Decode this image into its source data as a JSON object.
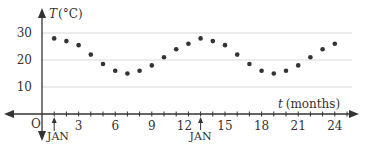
{
  "chart_data": {
    "type": "scatter",
    "title": "",
    "xlabel": "t (months)",
    "ylabel": "T (°C)",
    "x": [
      1,
      2,
      3,
      4,
      5,
      6,
      7,
      8,
      9,
      10,
      11,
      12,
      13,
      14,
      15,
      16,
      17,
      18,
      19,
      20,
      21,
      22,
      23,
      24
    ],
    "series": [
      {
        "name": "Temperature",
        "values": [
          28,
          27,
          25.5,
          22,
          18.5,
          16,
          15,
          16,
          18,
          21,
          24,
          26,
          28,
          27,
          25.5,
          22,
          18.5,
          16,
          15,
          16,
          18,
          21,
          24,
          26
        ]
      }
    ],
    "x_ticks": [
      "3",
      "6",
      "9",
      "12",
      "15",
      "18",
      "21",
      "24"
    ],
    "y_ticks": [
      "10",
      "20",
      "30"
    ],
    "origin_label": "O",
    "annotations": [
      {
        "label": "JAN",
        "x": 1
      },
      {
        "label": "JAN",
        "x": 13
      }
    ],
    "xlim": [
      0,
      26
    ],
    "ylim": [
      0,
      35
    ],
    "grid": "horizontal",
    "legend": "none"
  },
  "labels": {
    "y_axis_T": "T",
    "y_axis_unit": "(°C)",
    "x_axis_t": "t",
    "x_axis_unit": "(months)",
    "origin": "O",
    "jan1": "JAN",
    "jan2": "JAN"
  },
  "colors": {
    "axis": "#333333",
    "grid": "#d9d9d9",
    "points": "#333333"
  }
}
